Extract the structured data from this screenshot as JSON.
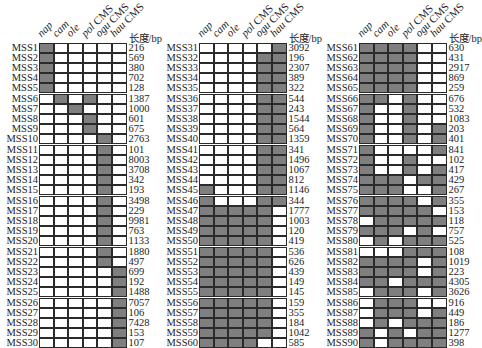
{
  "chart_data": {
    "type": "table",
    "title": "",
    "columns": [
      "nap",
      "cam",
      "ole",
      "pol CMS",
      "ogu CMS",
      "hau CMS"
    ],
    "columns_italic": [
      "nap",
      "cam",
      "ole",
      "pol",
      "ogu",
      "hau"
    ],
    "length_header": "长度/bp",
    "fill_color": "#7f7f7f",
    "empty_color": "#ffffff",
    "rows": [
      {
        "id": "MSS1",
        "len": 216,
        "m": [
          1,
          0,
          0,
          0,
          0,
          0
        ]
      },
      {
        "id": "MSS2",
        "len": 569,
        "m": [
          1,
          0,
          0,
          0,
          0,
          0
        ]
      },
      {
        "id": "MSS3",
        "len": 380,
        "m": [
          1,
          0,
          0,
          0,
          0,
          0
        ]
      },
      {
        "id": "MSS4",
        "len": 702,
        "m": [
          1,
          0,
          0,
          0,
          0,
          0
        ]
      },
      {
        "id": "MSS5",
        "len": 128,
        "m": [
          1,
          0,
          0,
          0,
          0,
          0
        ]
      },
      {
        "id": "MSS6",
        "len": 1387,
        "m": [
          0,
          1,
          0,
          1,
          0,
          0
        ]
      },
      {
        "id": "MSS7",
        "len": 1000,
        "m": [
          0,
          0,
          1,
          0,
          0,
          0
        ]
      },
      {
        "id": "MSS8",
        "len": 601,
        "m": [
          0,
          0,
          0,
          1,
          0,
          0
        ]
      },
      {
        "id": "MSS9",
        "len": 675,
        "m": [
          0,
          0,
          0,
          1,
          0,
          0
        ]
      },
      {
        "id": "MSS10",
        "len": 2763,
        "m": [
          0,
          0,
          0,
          0,
          1,
          0
        ]
      },
      {
        "id": "MSS11",
        "len": 101,
        "m": [
          0,
          0,
          0,
          0,
          1,
          0
        ]
      },
      {
        "id": "MSS12",
        "len": 8003,
        "m": [
          0,
          0,
          0,
          0,
          1,
          0
        ]
      },
      {
        "id": "MSS13",
        "len": 3708,
        "m": [
          0,
          0,
          0,
          0,
          1,
          0
        ]
      },
      {
        "id": "MSS14",
        "len": 342,
        "m": [
          0,
          0,
          0,
          0,
          1,
          0
        ]
      },
      {
        "id": "MSS15",
        "len": 193,
        "m": [
          0,
          0,
          0,
          0,
          1,
          0
        ]
      },
      {
        "id": "MSS16",
        "len": 3498,
        "m": [
          0,
          0,
          0,
          0,
          1,
          0
        ]
      },
      {
        "id": "MSS17",
        "len": 229,
        "m": [
          0,
          0,
          0,
          0,
          1,
          0
        ]
      },
      {
        "id": "MSS18",
        "len": 9981,
        "m": [
          0,
          0,
          0,
          0,
          1,
          0
        ]
      },
      {
        "id": "MSS19",
        "len": 763,
        "m": [
          0,
          0,
          0,
          0,
          1,
          0
        ]
      },
      {
        "id": "MSS20",
        "len": 1133,
        "m": [
          0,
          0,
          0,
          0,
          1,
          0
        ]
      },
      {
        "id": "MSS21",
        "len": 1880,
        "m": [
          0,
          0,
          0,
          0,
          1,
          0
        ]
      },
      {
        "id": "MSS22",
        "len": 497,
        "m": [
          0,
          0,
          0,
          0,
          1,
          0
        ]
      },
      {
        "id": "MSS23",
        "len": 699,
        "m": [
          0,
          0,
          0,
          0,
          0,
          1
        ]
      },
      {
        "id": "MSS24",
        "len": 192,
        "m": [
          0,
          0,
          0,
          0,
          0,
          1
        ]
      },
      {
        "id": "MSS25",
        "len": 1488,
        "m": [
          0,
          0,
          0,
          0,
          0,
          1
        ]
      },
      {
        "id": "MSS26",
        "len": 7057,
        "m": [
          0,
          0,
          0,
          0,
          0,
          1
        ]
      },
      {
        "id": "MSS27",
        "len": 106,
        "m": [
          0,
          0,
          0,
          0,
          0,
          1
        ]
      },
      {
        "id": "MSS28",
        "len": 7428,
        "m": [
          0,
          0,
          0,
          0,
          0,
          1
        ]
      },
      {
        "id": "MSS29",
        "len": 153,
        "m": [
          0,
          0,
          0,
          0,
          0,
          1
        ]
      },
      {
        "id": "MSS30",
        "len": 107,
        "m": [
          0,
          0,
          0,
          0,
          0,
          1
        ]
      },
      {
        "id": "MSS31",
        "len": 3092,
        "m": [
          0,
          0,
          0,
          0,
          0,
          1
        ]
      },
      {
        "id": "MSS32",
        "len": 196,
        "m": [
          0,
          0,
          0,
          0,
          1,
          1
        ]
      },
      {
        "id": "MSS33",
        "len": 2307,
        "m": [
          0,
          0,
          0,
          0,
          1,
          1
        ]
      },
      {
        "id": "MSS34",
        "len": 389,
        "m": [
          0,
          0,
          0,
          0,
          1,
          1
        ]
      },
      {
        "id": "MSS35",
        "len": 322,
        "m": [
          0,
          0,
          0,
          0,
          1,
          1
        ]
      },
      {
        "id": "MSS36",
        "len": 544,
        "m": [
          0,
          0,
          0,
          0,
          1,
          1
        ]
      },
      {
        "id": "MSS37",
        "len": 243,
        "m": [
          0,
          0,
          0,
          0,
          1,
          1
        ]
      },
      {
        "id": "MSS38",
        "len": 1544,
        "m": [
          0,
          0,
          0,
          0,
          1,
          1
        ]
      },
      {
        "id": "MSS39",
        "len": 564,
        "m": [
          0,
          0,
          0,
          0,
          1,
          1
        ]
      },
      {
        "id": "MSS40",
        "len": 1359,
        "m": [
          0,
          0,
          0,
          0,
          1,
          1
        ]
      },
      {
        "id": "MSS41",
        "len": 341,
        "m": [
          0,
          0,
          0,
          0,
          1,
          1
        ]
      },
      {
        "id": "MSS42",
        "len": 1496,
        "m": [
          0,
          0,
          0,
          0,
          1,
          1
        ]
      },
      {
        "id": "MSS43",
        "len": 1067,
        "m": [
          0,
          0,
          0,
          0,
          1,
          1
        ]
      },
      {
        "id": "MSS44",
        "len": 812,
        "m": [
          0,
          0,
          0,
          0,
          1,
          1
        ]
      },
      {
        "id": "MSS45",
        "len": 1146,
        "m": [
          1,
          0,
          0,
          0,
          1,
          1
        ]
      },
      {
        "id": "MSS46",
        "len": 344,
        "m": [
          1,
          0,
          0,
          0,
          1,
          1
        ]
      },
      {
        "id": "MSS47",
        "len": 1777,
        "m": [
          1,
          1,
          1,
          1,
          1,
          0
        ]
      },
      {
        "id": "MSS48",
        "len": 1003,
        "m": [
          1,
          1,
          1,
          1,
          1,
          0
        ]
      },
      {
        "id": "MSS49",
        "len": 120,
        "m": [
          1,
          1,
          1,
          1,
          1,
          0
        ]
      },
      {
        "id": "MSS50",
        "len": 419,
        "m": [
          1,
          1,
          1,
          1,
          1,
          0
        ]
      },
      {
        "id": "MSS51",
        "len": 536,
        "m": [
          1,
          1,
          1,
          1,
          1,
          0
        ]
      },
      {
        "id": "MSS52",
        "len": 626,
        "m": [
          1,
          1,
          1,
          1,
          1,
          0
        ]
      },
      {
        "id": "MSS53",
        "len": 439,
        "m": [
          1,
          1,
          1,
          1,
          1,
          0
        ]
      },
      {
        "id": "MSS54",
        "len": 149,
        "m": [
          1,
          1,
          1,
          1,
          1,
          0
        ]
      },
      {
        "id": "MSS55",
        "len": 145,
        "m": [
          1,
          1,
          1,
          1,
          1,
          0
        ]
      },
      {
        "id": "MSS56",
        "len": 159,
        "m": [
          1,
          1,
          1,
          1,
          1,
          0
        ]
      },
      {
        "id": "MSS57",
        "len": 355,
        "m": [
          1,
          1,
          1,
          1,
          1,
          0
        ]
      },
      {
        "id": "MSS58",
        "len": 184,
        "m": [
          1,
          1,
          1,
          1,
          1,
          0
        ]
      },
      {
        "id": "MSS59",
        "len": 1042,
        "m": [
          1,
          1,
          1,
          1,
          1,
          0
        ]
      },
      {
        "id": "MSS60",
        "len": 585,
        "m": [
          1,
          1,
          1,
          1,
          0,
          0
        ]
      },
      {
        "id": "MSS61",
        "len": 630,
        "m": [
          1,
          1,
          1,
          1,
          0,
          0
        ]
      },
      {
        "id": "MSS62",
        "len": 431,
        "m": [
          1,
          1,
          1,
          1,
          0,
          0
        ]
      },
      {
        "id": "MSS63",
        "len": 2917,
        "m": [
          1,
          1,
          1,
          1,
          0,
          0
        ]
      },
      {
        "id": "MSS64",
        "len": 869,
        "m": [
          1,
          1,
          1,
          1,
          0,
          0
        ]
      },
      {
        "id": "MSS65",
        "len": 259,
        "m": [
          1,
          1,
          1,
          1,
          0,
          0
        ]
      },
      {
        "id": "MSS66",
        "len": 676,
        "m": [
          1,
          1,
          0,
          1,
          0,
          0
        ]
      },
      {
        "id": "MSS67",
        "len": 532,
        "m": [
          1,
          0,
          0,
          1,
          0,
          0
        ]
      },
      {
        "id": "MSS68",
        "len": 1083,
        "m": [
          1,
          0,
          0,
          1,
          0,
          0
        ]
      },
      {
        "id": "MSS69",
        "len": 203,
        "m": [
          1,
          0,
          0,
          1,
          0,
          1
        ]
      },
      {
        "id": "MSS70",
        "len": 401,
        "m": [
          1,
          0,
          0,
          1,
          0,
          1
        ]
      },
      {
        "id": "MSS71",
        "len": 841,
        "m": [
          1,
          0,
          0,
          0,
          0,
          1
        ]
      },
      {
        "id": "MSS72",
        "len": 102,
        "m": [
          1,
          0,
          0,
          1,
          0,
          0
        ]
      },
      {
        "id": "MSS73",
        "len": 417,
        "m": [
          1,
          0,
          0,
          1,
          0,
          1
        ]
      },
      {
        "id": "MSS74",
        "len": 429,
        "m": [
          1,
          1,
          1,
          0,
          1,
          1
        ]
      },
      {
        "id": "MSS75",
        "len": 267,
        "m": [
          1,
          1,
          1,
          0,
          0,
          1
        ]
      },
      {
        "id": "MSS76",
        "len": 355,
        "m": [
          1,
          1,
          1,
          1,
          0,
          1
        ]
      },
      {
        "id": "MSS77",
        "len": 153,
        "m": [
          1,
          1,
          1,
          1,
          1,
          0
        ]
      },
      {
        "id": "MSS78",
        "len": 118,
        "m": [
          0,
          1,
          1,
          1,
          1,
          1
        ]
      },
      {
        "id": "MSS79",
        "len": 757,
        "m": [
          1,
          1,
          1,
          0,
          1,
          0
        ]
      },
      {
        "id": "MSS80",
        "len": 525,
        "m": [
          0,
          1,
          0,
          1,
          1,
          1
        ]
      },
      {
        "id": "MSS81",
        "len": 108,
        "m": [
          0,
          0,
          0,
          1,
          1,
          1
        ]
      },
      {
        "id": "MSS82",
        "len": 1019,
        "m": [
          1,
          1,
          1,
          1,
          0,
          1
        ]
      },
      {
        "id": "MSS83",
        "len": 223,
        "m": [
          1,
          1,
          1,
          1,
          0,
          1
        ]
      },
      {
        "id": "MSS84",
        "len": 4305,
        "m": [
          1,
          1,
          0,
          1,
          1,
          1
        ]
      },
      {
        "id": "MSS85",
        "len": 3626,
        "m": [
          0,
          1,
          1,
          1,
          0,
          1
        ]
      },
      {
        "id": "MSS86",
        "len": 916,
        "m": [
          0,
          1,
          1,
          1,
          0,
          0
        ]
      },
      {
        "id": "MSS87",
        "len": 449,
        "m": [
          0,
          1,
          1,
          1,
          0,
          1
        ]
      },
      {
        "id": "MSS88",
        "len": 186,
        "m": [
          0,
          1,
          0,
          1,
          1,
          1
        ]
      },
      {
        "id": "MSS89",
        "len": 1277,
        "m": [
          1,
          0,
          1,
          0,
          1,
          1
        ]
      },
      {
        "id": "MSS90",
        "len": 398,
        "m": [
          1,
          0,
          1,
          1,
          1,
          1
        ]
      }
    ],
    "panels": 3,
    "rows_per_panel": 30
  }
}
